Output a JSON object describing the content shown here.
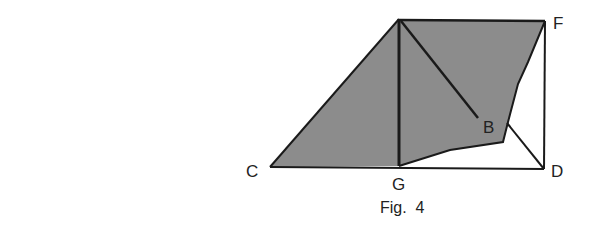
{
  "figure": {
    "caption": "Fig.  4",
    "colors": {
      "fill": "#8c8c8c",
      "stroke": "#1a1a1a",
      "label": "#222222",
      "background": "#ffffff"
    },
    "labels": {
      "C": "C",
      "G": "G",
      "D": "D",
      "F": "F",
      "B": "B"
    },
    "points": {
      "A": [
        399,
        19
      ],
      "F": [
        545,
        21
      ],
      "C": [
        270,
        167
      ],
      "G": [
        399,
        166
      ],
      "D": [
        544,
        169
      ],
      "B_end": [
        478,
        118
      ],
      "kink": [
        507,
        123
      ]
    }
  }
}
